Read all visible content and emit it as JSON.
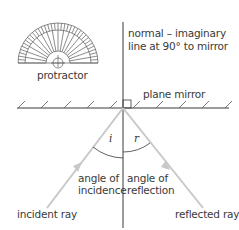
{
  "diagram": {
    "type": "law-of-reflection",
    "colors": {
      "line": "#3a3a3a",
      "ray": "#c8c8c8",
      "text": "#3a3a3a",
      "background": "#ffffff"
    },
    "labels": {
      "protractor": "protractor",
      "normal_line1": "normal – imaginary",
      "normal_line2": "line at 90° to mirror",
      "plane_mirror": "plane mirror",
      "angle_i": "i",
      "angle_r": "r",
      "incidence_line1": "angle of",
      "incidence_line2": "incidence",
      "reflection_line1": "angle of",
      "reflection_line2": "reflection",
      "incident_ray": "incident ray",
      "reflected_ray": "reflected ray"
    },
    "icons": {
      "protractor": "protractor-icon",
      "mirror_hatching": "mirror-hatch-icon",
      "right_angle": "right-angle-marker-icon",
      "ray_arrow": "arrow-icon"
    }
  }
}
